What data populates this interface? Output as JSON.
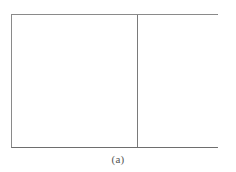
{
  "figure": {
    "caption": "(a)",
    "background_color": "#ffffff",
    "border_color": "#8a8a8a",
    "divider_color": "#7a7a7a",
    "caption_color": "#555555",
    "panels": [
      {
        "name": "left-panel",
        "content": "",
        "fill_color": "#ffffff"
      },
      {
        "name": "right-panel",
        "content": "",
        "fill_color": "#ffffff"
      }
    ]
  }
}
